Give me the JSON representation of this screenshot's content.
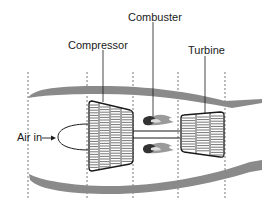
{
  "diagram": {
    "type": "jet-engine-schematic",
    "labels": {
      "compressor": "Compressor",
      "combuster": "Combuster",
      "turbine": "Turbine",
      "air_in": "Air in"
    },
    "colors": {
      "casing": "#8a8a8a",
      "outline": "#1a1a1a",
      "flame": "#9a9a9a",
      "flame_core": "#333333",
      "dashed": "#555555",
      "background": "#ffffff"
    },
    "stations_x": [
      28,
      87,
      133,
      178,
      225
    ]
  }
}
